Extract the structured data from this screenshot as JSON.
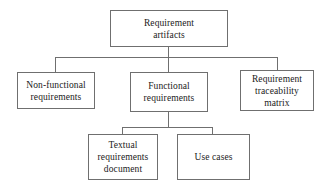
{
  "diagram": {
    "type": "hierarchy-tree",
    "colors": {
      "background": "#ffffff",
      "box_border": "#6f6f6f",
      "connector": "#6f6f6f",
      "text": "#1a1a1a"
    },
    "nodes": {
      "root": {
        "label": "Requirement\nartifacts",
        "level": 0
      },
      "non_functional": {
        "label": "Non-functional\nrequirements",
        "level": 1
      },
      "functional": {
        "label": "Functional\nrequirements",
        "level": 1
      },
      "traceability": {
        "label": "Requirement\ntraceability\nmatrix",
        "level": 1
      },
      "textual": {
        "label": "Textual\nrequirements\ndocument",
        "level": 2
      },
      "use_cases": {
        "label": "Use cases",
        "level": 2
      }
    },
    "edges": [
      {
        "from": "root",
        "to": "non_functional"
      },
      {
        "from": "root",
        "to": "functional"
      },
      {
        "from": "root",
        "to": "traceability"
      },
      {
        "from": "functional",
        "to": "textual"
      },
      {
        "from": "functional",
        "to": "use_cases"
      }
    ]
  }
}
